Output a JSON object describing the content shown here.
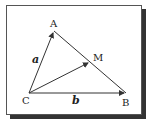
{
  "diagram": {
    "type": "vector-triangle",
    "points": {
      "A": {
        "label": "A",
        "x": 54,
        "y": 31
      },
      "B": {
        "label": "B",
        "x": 126,
        "y": 93
      },
      "C": {
        "label": "C",
        "x": 29,
        "y": 93
      },
      "M": {
        "label": "M",
        "x": 90,
        "y": 62
      }
    },
    "vectors": [
      {
        "from": "C",
        "to": "A",
        "label": "a"
      },
      {
        "from": "C",
        "to": "B",
        "label": "b"
      },
      {
        "from": "C",
        "to": "M",
        "label": ""
      }
    ],
    "segments": [
      {
        "from": "A",
        "to": "B"
      }
    ],
    "labels": {
      "a": "a",
      "b": "b",
      "A": "A",
      "B": "B",
      "C": "C",
      "M": "M"
    },
    "colors": {
      "line": "#333333",
      "frame": "#555555",
      "shadow": "#333333"
    }
  }
}
